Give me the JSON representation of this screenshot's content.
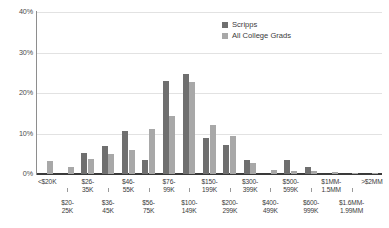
{
  "chart_data": {
    "type": "bar",
    "title": "",
    "xlabel": "",
    "ylabel": "",
    "ylim": [
      0,
      40
    ],
    "yticks": [
      "0%",
      "10%",
      "20%",
      "30%",
      "40%"
    ],
    "ytick_values": [
      0,
      10,
      20,
      30,
      40
    ],
    "grid": true,
    "legend_position": "top-right",
    "categories": [
      "<$20K",
      "$20-\n25K",
      "$26-\n35K",
      "$36-\n45K",
      "$46-\n55K",
      "$56-\n75K",
      "$76-\n99K",
      "$100-\n149K",
      "$150-\n199K",
      "$200-\n299K",
      "$300-\n399K",
      "$400-\n499K",
      "$500-\n599K",
      "$600-\n999K",
      "$1MM-\n1.5MM",
      "$1.6MM-\n1.99MM",
      ">$2MM"
    ],
    "series": [
      {
        "name": "Scripps",
        "color": "#6f6f6f",
        "values": [
          0,
          0,
          5.2,
          7.0,
          10.6,
          3.5,
          23.0,
          24.8,
          9.0,
          7.1,
          3.5,
          0,
          3.5,
          1.7,
          0,
          0,
          0
        ]
      },
      {
        "name": "All College Grads",
        "color": "#a8a8a8",
        "values": [
          3.1,
          1.7,
          3.6,
          4.9,
          5.9,
          11.0,
          14.4,
          22.6,
          12.0,
          9.3,
          2.7,
          1.1,
          0.8,
          0.8,
          0.4,
          0.2,
          0.3
        ]
      }
    ]
  },
  "legend": {
    "items": [
      {
        "label": "Scripps",
        "color": "#6f6f6f"
      },
      {
        "label": "All College Grads",
        "color": "#a8a8a8"
      }
    ]
  },
  "colors": {
    "series_scripps": "#6f6f6f",
    "series_grads": "#a8a8a8",
    "gridline": "#e2e2e2",
    "axis": "#3a3a3a",
    "text": "#3b3b3b",
    "background": "#ffffff"
  }
}
